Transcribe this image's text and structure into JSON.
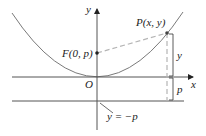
{
  "diagram": {
    "type": "parabola-focus-directrix",
    "labels": {
      "y_axis": "y",
      "x_axis": "x",
      "origin": "O",
      "focus": "F(0, p)",
      "point": "P(x, y)",
      "distance_y": "y",
      "distance_p": "p",
      "directrix": "y = −p"
    },
    "colors": {
      "curve": "#6b6b6b",
      "axis": "#555555",
      "dashed": "#b5b5b5",
      "text": "#222222"
    }
  }
}
